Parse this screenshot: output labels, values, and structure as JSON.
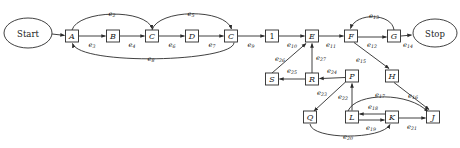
{
  "diagram": {
    "type": "directed-graph",
    "canvas": {
      "width": 460,
      "height": 148
    },
    "colors": {
      "background": "#ffffff",
      "stroke": "#2b2b2b",
      "node_fill": "#ffffff",
      "text": "#1a1a1a"
    },
    "nodes": [
      {
        "id": "start",
        "label": "Start",
        "shape": "ellipse",
        "cx": 28,
        "cy": 33,
        "rx": 24,
        "ry": 15
      },
      {
        "id": "A",
        "label": "A",
        "shape": "rect",
        "cx": 72,
        "cy": 36,
        "w": 13,
        "h": 12
      },
      {
        "id": "B",
        "label": "B",
        "shape": "rect",
        "cx": 113,
        "cy": 36,
        "w": 13,
        "h": 12
      },
      {
        "id": "C1",
        "label": "C",
        "shape": "rect",
        "cx": 152,
        "cy": 36,
        "w": 13,
        "h": 12
      },
      {
        "id": "D",
        "label": "D",
        "shape": "rect",
        "cx": 192,
        "cy": 36,
        "w": 13,
        "h": 12
      },
      {
        "id": "C2",
        "label": "C",
        "shape": "rect",
        "cx": 231,
        "cy": 36,
        "w": 13,
        "h": 12
      },
      {
        "id": "N1",
        "label": "1",
        "shape": "rect",
        "cx": 272,
        "cy": 36,
        "w": 13,
        "h": 12
      },
      {
        "id": "E",
        "label": "E",
        "shape": "rect",
        "cx": 312,
        "cy": 36,
        "w": 13,
        "h": 12
      },
      {
        "id": "F",
        "label": "F",
        "shape": "rect",
        "cx": 351,
        "cy": 36,
        "w": 13,
        "h": 12
      },
      {
        "id": "G",
        "label": "G",
        "shape": "rect",
        "cx": 394,
        "cy": 36,
        "w": 13,
        "h": 12
      },
      {
        "id": "stop",
        "label": "Stop",
        "shape": "ellipse",
        "cx": 435,
        "cy": 33,
        "rx": 22,
        "ry": 14
      },
      {
        "id": "S",
        "label": "S",
        "shape": "rect",
        "cx": 272,
        "cy": 79,
        "w": 13,
        "h": 12
      },
      {
        "id": "R",
        "label": "R",
        "shape": "rect",
        "cx": 312,
        "cy": 79,
        "w": 13,
        "h": 12
      },
      {
        "id": "P",
        "label": "P",
        "shape": "rect",
        "cx": 352,
        "cy": 76,
        "w": 13,
        "h": 12
      },
      {
        "id": "H",
        "label": "H",
        "shape": "rect",
        "cx": 392,
        "cy": 76,
        "w": 13,
        "h": 12
      },
      {
        "id": "Q",
        "label": "Q",
        "shape": "rect",
        "cx": 310,
        "cy": 117,
        "w": 13,
        "h": 12
      },
      {
        "id": "L",
        "label": "L",
        "shape": "rect",
        "cx": 352,
        "cy": 117,
        "w": 13,
        "h": 12
      },
      {
        "id": "K",
        "label": "K",
        "shape": "rect",
        "cx": 392,
        "cy": 117,
        "w": 13,
        "h": 12
      },
      {
        "id": "J",
        "label": "J",
        "shape": "rect",
        "cx": 433,
        "cy": 117,
        "w": 13,
        "h": 12
      }
    ],
    "edges": [
      {
        "id": "e1",
        "label": "e",
        "sub": "1",
        "from": "start",
        "to": "A",
        "label_x": 40,
        "label_y": 42
      },
      {
        "id": "e2",
        "label": "e",
        "sub": "2",
        "from": "A",
        "to": "C1",
        "label_x": 112,
        "label_y": 14
      },
      {
        "id": "e3",
        "label": "e",
        "sub": "3",
        "from": "A",
        "to": "B",
        "label_x": 92,
        "label_y": 44
      },
      {
        "id": "e4",
        "label": "e",
        "sub": "4",
        "from": "B",
        "to": "C1",
        "label_x": 132,
        "label_y": 44
      },
      {
        "id": "e5",
        "label": "e",
        "sub": "5",
        "from": "C1",
        "to": "C2",
        "label_x": 191,
        "label_y": 14
      },
      {
        "id": "e6",
        "label": "e",
        "sub": "6",
        "from": "C1",
        "to": "D",
        "label_x": 172,
        "label_y": 44
      },
      {
        "id": "e7",
        "label": "e",
        "sub": "7",
        "from": "D",
        "to": "C2",
        "label_x": 212,
        "label_y": 44
      },
      {
        "id": "e8",
        "label": "e",
        "sub": "8",
        "from": "C2",
        "to": "A",
        "label_x": 151,
        "label_y": 61
      },
      {
        "id": "e9",
        "label": "e",
        "sub": "9",
        "from": "C2",
        "to": "N1",
        "label_x": 251,
        "label_y": 44
      },
      {
        "id": "e10",
        "label": "e",
        "sub": "10",
        "from": "N1",
        "to": "E",
        "label_x": 292,
        "label_y": 44
      },
      {
        "id": "e11",
        "label": "e",
        "sub": "11",
        "from": "E",
        "to": "F",
        "label_x": 331,
        "label_y": 44
      },
      {
        "id": "e12",
        "label": "e",
        "sub": "12",
        "from": "F",
        "to": "G",
        "label_x": 372,
        "label_y": 44
      },
      {
        "id": "e13",
        "label": "e",
        "sub": "13",
        "from": "G",
        "to": "F",
        "label_x": 373,
        "label_y": 15
      },
      {
        "id": "e14",
        "label": "e",
        "sub": "14",
        "from": "G",
        "to": "stop",
        "label_x": 406,
        "label_y": 44
      },
      {
        "id": "e15",
        "label": "e",
        "sub": "15",
        "from": "F",
        "to": "H",
        "label_x": 362,
        "label_y": 60
      },
      {
        "id": "e16",
        "label": "e",
        "sub": "16",
        "from": "H",
        "to": "J",
        "label_x": 412,
        "label_y": 96
      },
      {
        "id": "e17",
        "label": "e",
        "sub": "17",
        "from": "L",
        "to": "J",
        "label_x": 381,
        "label_y": 95
      },
      {
        "id": "e18",
        "label": "e",
        "sub": "18",
        "from": "K",
        "to": "L",
        "label_x": 372,
        "label_y": 109
      },
      {
        "id": "e19",
        "label": "e",
        "sub": "19",
        "from": "L",
        "to": "K",
        "label_x": 372,
        "label_y": 126
      },
      {
        "id": "e20",
        "label": "e",
        "sub": "20",
        "from": "Q",
        "to": "K",
        "label_x": 348,
        "label_y": 138
      },
      {
        "id": "e21",
        "label": "e",
        "sub": "21",
        "from": "K",
        "to": "J",
        "label_x": 412,
        "label_y": 126
      },
      {
        "id": "e22",
        "label": "e",
        "sub": "22",
        "from": "L",
        "to": "P",
        "label_x": 343,
        "label_y": 97
      },
      {
        "id": "e23",
        "label": "e",
        "sub": "23",
        "from": "P",
        "to": "Q",
        "label_x": 322,
        "label_y": 95
      },
      {
        "id": "e24",
        "label": "e",
        "sub": "24",
        "from": "P",
        "to": "R",
        "label_x": 332,
        "label_y": 72
      },
      {
        "id": "e25",
        "label": "e",
        "sub": "25",
        "from": "R",
        "to": "S",
        "label_x": 292,
        "label_y": 72
      },
      {
        "id": "e26",
        "label": "e",
        "sub": "26",
        "from": "S",
        "to": "E",
        "label_x": 281,
        "label_y": 58
      },
      {
        "id": "e27",
        "label": "e",
        "sub": "27",
        "from": "R",
        "to": "E",
        "label_x": 320,
        "label_y": 58
      }
    ]
  }
}
